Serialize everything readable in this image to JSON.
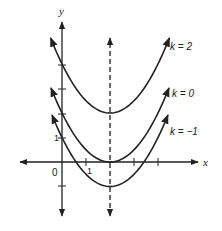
{
  "figure": {
    "axes": {
      "x_label": "x",
      "y_label": "y",
      "origin_label": "0",
      "x_tick_label": "1",
      "y_tick_label": "1"
    },
    "curves": [
      {
        "label": "k = 2",
        "k": 2
      },
      {
        "label": "k = 0",
        "k": 0
      },
      {
        "label": "k = −1",
        "k": -1
      }
    ],
    "axis_of_symmetry_x": 2,
    "colors": {
      "ink": "#222222",
      "background": "#ffffff"
    }
  }
}
